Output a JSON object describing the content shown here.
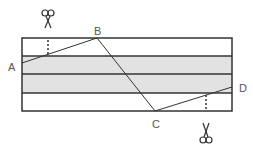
{
  "diagram": {
    "type": "folded-strip-cut-diagram",
    "colors": {
      "outline": "#333333",
      "shade": "#e2e2e2",
      "fold_line": "#333333",
      "label": "#555555"
    },
    "points": [
      {
        "label": "A",
        "x": 22,
        "y": 63
      },
      {
        "label": "B",
        "x": 97,
        "y": 38
      },
      {
        "label": "C",
        "x": 155,
        "y": 111
      },
      {
        "label": "D",
        "x": 232,
        "y": 87
      }
    ],
    "bands": 4,
    "shaded_bands": [
      2,
      3
    ],
    "scissors": [
      {
        "position": "top",
        "x": 48
      },
      {
        "position": "bottom",
        "x": 206
      }
    ]
  }
}
